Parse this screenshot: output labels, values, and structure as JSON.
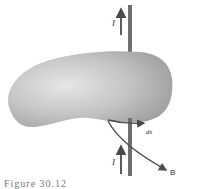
{
  "figure": {
    "caption": "Figure 30.12",
    "labels": {
      "current_top": "I",
      "current_bottom": "I",
      "line_element": "ds",
      "field": "B"
    },
    "colors": {
      "surface": "#b8b8b8",
      "surface_highlight": "#e0e0e0",
      "wire": "#6e6e6e",
      "arrows": "#4a4a4a",
      "background": "#ffffff"
    }
  }
}
